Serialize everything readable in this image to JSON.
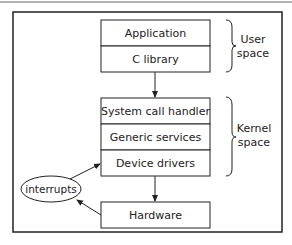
{
  "diagram": {
    "title": "",
    "colors": {
      "stroke": "#222222",
      "text": "#222222",
      "background": "#ffffff",
      "top_rule": "#9a9a9a"
    },
    "blocks": {
      "user": [
        {
          "id": "application",
          "label": "Application"
        },
        {
          "id": "c-library",
          "label": "C library"
        }
      ],
      "kernel": [
        {
          "id": "system-call-handler",
          "label": "System call handler"
        },
        {
          "id": "generic-services",
          "label": "Generic services"
        },
        {
          "id": "device-drivers",
          "label": "Device drivers"
        }
      ],
      "hardware": {
        "id": "hardware",
        "label": "Hardware"
      }
    },
    "interrupts": {
      "label": "interrupts"
    },
    "regions": {
      "user": {
        "line1": "User",
        "line2": "space"
      },
      "kernel": {
        "line1": "Kernel",
        "line2": "space"
      }
    },
    "edges": [
      {
        "from": "c-library",
        "to": "system-call-handler"
      },
      {
        "from": "device-drivers",
        "to": "hardware"
      },
      {
        "from": "hardware",
        "to": "interrupts"
      },
      {
        "from": "interrupts",
        "to": "device-drivers"
      }
    ]
  }
}
